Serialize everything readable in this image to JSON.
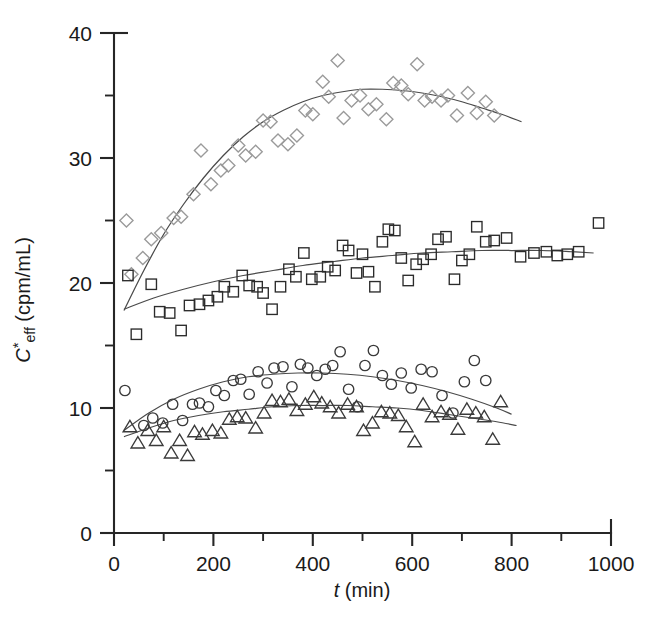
{
  "figure": {
    "background": "#ffffff",
    "width": 650,
    "height": 629
  },
  "axes": {
    "x_title_italic": "t",
    "x_title_units": " (min)",
    "y_title_italic": "C",
    "y_title_star": "*",
    "y_title_sub": "eff",
    "y_title_units": " (cpm/mL)",
    "x_ticks": [
      "0",
      "200",
      "400",
      "600",
      "800",
      "1000"
    ],
    "y_ticks": [
      "0",
      "10",
      "20",
      "30",
      "40"
    ],
    "x_minor_count": 5,
    "y_minor_count": 4,
    "axis_color": "#262626"
  },
  "chart_data": {
    "type": "scatter",
    "title": "",
    "xlabel": "t (min)",
    "ylabel": "C*eff (cpm/mL)",
    "xlim": [
      0,
      1000
    ],
    "ylim": [
      0,
      40
    ],
    "xticks": [
      0,
      200,
      400,
      600,
      800,
      1000
    ],
    "yticks": [
      0,
      10,
      20,
      30,
      40
    ],
    "xminor_step": 100,
    "yminor_step": 5,
    "grid": false,
    "legend": "none",
    "marker_style": "open",
    "series": [
      {
        "name": "diamond",
        "marker": "diamond",
        "color": "#9a9a9a",
        "points": [
          [
            25,
            25.0
          ],
          [
            35,
            20.7
          ],
          [
            58,
            22.0
          ],
          [
            75,
            23.5
          ],
          [
            95,
            24.0
          ],
          [
            120,
            25.2
          ],
          [
            135,
            25.3
          ],
          [
            160,
            27.1
          ],
          [
            175,
            30.6
          ],
          [
            195,
            27.9
          ],
          [
            215,
            29.0
          ],
          [
            230,
            29.4
          ],
          [
            250,
            31.0
          ],
          [
            265,
            30.2
          ],
          [
            285,
            30.5
          ],
          [
            300,
            33.0
          ],
          [
            315,
            32.9
          ],
          [
            330,
            31.4
          ],
          [
            350,
            31.1
          ],
          [
            368,
            31.8
          ],
          [
            385,
            33.8
          ],
          [
            400,
            33.5
          ],
          [
            420,
            36.1
          ],
          [
            432,
            34.9
          ],
          [
            450,
            37.8
          ],
          [
            462,
            33.2
          ],
          [
            478,
            34.6
          ],
          [
            495,
            35.0
          ],
          [
            512,
            33.9
          ],
          [
            528,
            34.3
          ],
          [
            548,
            33.1
          ],
          [
            562,
            36.0
          ],
          [
            578,
            35.8
          ],
          [
            592,
            35.1
          ],
          [
            610,
            37.5
          ],
          [
            625,
            34.6
          ],
          [
            640,
            34.9
          ],
          [
            658,
            34.6
          ],
          [
            672,
            35.0
          ],
          [
            690,
            33.4
          ],
          [
            712,
            35.2
          ],
          [
            730,
            33.6
          ],
          [
            748,
            34.5
          ],
          [
            765,
            33.4
          ]
        ],
        "fit_points": [
          [
            20,
            17.8
          ],
          [
            60,
            21.0
          ],
          [
            100,
            23.9
          ],
          [
            140,
            26.3
          ],
          [
            180,
            28.4
          ],
          [
            220,
            30.2
          ],
          [
            260,
            31.7
          ],
          [
            300,
            32.9
          ],
          [
            340,
            33.8
          ],
          [
            380,
            34.5
          ],
          [
            420,
            35.0
          ],
          [
            460,
            35.3
          ],
          [
            500,
            35.5
          ],
          [
            540,
            35.5
          ],
          [
            580,
            35.4
          ],
          [
            620,
            35.2
          ],
          [
            660,
            34.9
          ],
          [
            700,
            34.5
          ],
          [
            740,
            34.0
          ],
          [
            780,
            33.5
          ],
          [
            820,
            32.9
          ]
        ]
      },
      {
        "name": "square",
        "marker": "square",
        "color": "#2b2b2b",
        "points": [
          [
            28,
            20.6
          ],
          [
            45,
            15.9
          ],
          [
            75,
            19.9
          ],
          [
            92,
            17.7
          ],
          [
            112,
            17.6
          ],
          [
            135,
            16.2
          ],
          [
            152,
            18.2
          ],
          [
            172,
            18.3
          ],
          [
            190,
            18.6
          ],
          [
            208,
            18.9
          ],
          [
            222,
            19.7
          ],
          [
            240,
            19.3
          ],
          [
            258,
            20.6
          ],
          [
            272,
            19.8
          ],
          [
            288,
            19.7
          ],
          [
            300,
            19.2
          ],
          [
            318,
            17.9
          ],
          [
            335,
            19.7
          ],
          [
            352,
            21.1
          ],
          [
            366,
            20.5
          ],
          [
            382,
            22.4
          ],
          [
            398,
            20.3
          ],
          [
            415,
            20.5
          ],
          [
            430,
            21.3
          ],
          [
            445,
            21.0
          ],
          [
            460,
            23.0
          ],
          [
            472,
            22.6
          ],
          [
            488,
            20.8
          ],
          [
            500,
            22.3
          ],
          [
            512,
            20.9
          ],
          [
            525,
            19.7
          ],
          [
            540,
            23.3
          ],
          [
            552,
            24.3
          ],
          [
            565,
            24.2
          ],
          [
            578,
            22.0
          ],
          [
            592,
            20.2
          ],
          [
            608,
            21.5
          ],
          [
            622,
            21.9
          ],
          [
            638,
            22.3
          ],
          [
            652,
            23.5
          ],
          [
            668,
            23.7
          ],
          [
            685,
            20.3
          ],
          [
            700,
            21.8
          ],
          [
            715,
            22.3
          ],
          [
            730,
            24.5
          ],
          [
            748,
            23.3
          ],
          [
            765,
            23.4
          ],
          [
            790,
            23.6
          ],
          [
            818,
            22.1
          ],
          [
            845,
            22.4
          ],
          [
            870,
            22.5
          ],
          [
            892,
            22.2
          ],
          [
            912,
            22.3
          ],
          [
            935,
            22.5
          ],
          [
            975,
            24.8
          ]
        ],
        "fit_points": [
          [
            20,
            17.9
          ],
          [
            80,
            18.8
          ],
          [
            140,
            19.5
          ],
          [
            200,
            20.1
          ],
          [
            260,
            20.6
          ],
          [
            320,
            21.0
          ],
          [
            380,
            21.4
          ],
          [
            440,
            21.7
          ],
          [
            500,
            22.0
          ],
          [
            560,
            22.2
          ],
          [
            620,
            22.4
          ],
          [
            680,
            22.5
          ],
          [
            740,
            22.6
          ],
          [
            800,
            22.6
          ],
          [
            860,
            22.6
          ],
          [
            920,
            22.5
          ],
          [
            965,
            22.4
          ]
        ]
      },
      {
        "name": "circle",
        "marker": "circle",
        "color": "#3a3a3a",
        "points": [
          [
            22,
            11.4
          ],
          [
            60,
            8.6
          ],
          [
            78,
            9.2
          ],
          [
            98,
            8.8
          ],
          [
            118,
            10.3
          ],
          [
            138,
            9.0
          ],
          [
            158,
            10.3
          ],
          [
            172,
            10.4
          ],
          [
            190,
            10.1
          ],
          [
            205,
            11.4
          ],
          [
            222,
            11.0
          ],
          [
            240,
            12.2
          ],
          [
            255,
            12.3
          ],
          [
            272,
            11.1
          ],
          [
            290,
            12.9
          ],
          [
            308,
            12.0
          ],
          [
            322,
            13.2
          ],
          [
            340,
            13.3
          ],
          [
            358,
            11.7
          ],
          [
            375,
            13.5
          ],
          [
            390,
            13.2
          ],
          [
            408,
            12.6
          ],
          [
            425,
            13.1
          ],
          [
            440,
            13.4
          ],
          [
            455,
            14.5
          ],
          [
            472,
            11.5
          ],
          [
            490,
            10.1
          ],
          [
            505,
            13.4
          ],
          [
            522,
            14.6
          ],
          [
            540,
            12.6
          ],
          [
            558,
            11.9
          ],
          [
            578,
            12.8
          ],
          [
            598,
            11.6
          ],
          [
            618,
            13.1
          ],
          [
            640,
            12.9
          ],
          [
            660,
            11.0
          ],
          [
            682,
            9.6
          ],
          [
            705,
            12.1
          ],
          [
            725,
            13.8
          ],
          [
            748,
            12.2
          ]
        ],
        "fit_points": [
          [
            20,
            8.2
          ],
          [
            70,
            9.6
          ],
          [
            120,
            10.7
          ],
          [
            170,
            11.5
          ],
          [
            220,
            12.1
          ],
          [
            270,
            12.5
          ],
          [
            320,
            12.7
          ],
          [
            370,
            12.8
          ],
          [
            420,
            12.8
          ],
          [
            470,
            12.7
          ],
          [
            520,
            12.5
          ],
          [
            570,
            12.2
          ],
          [
            620,
            11.8
          ],
          [
            670,
            11.3
          ],
          [
            720,
            10.7
          ],
          [
            770,
            10.0
          ],
          [
            800,
            9.5
          ]
        ]
      },
      {
        "name": "triangle",
        "marker": "triangle",
        "color": "#3a3a3a",
        "points": [
          [
            32,
            8.5
          ],
          [
            48,
            7.2
          ],
          [
            68,
            8.2
          ],
          [
            85,
            7.4
          ],
          [
            100,
            8.5
          ],
          [
            115,
            6.4
          ],
          [
            132,
            7.4
          ],
          [
            148,
            6.2
          ],
          [
            162,
            8.1
          ],
          [
            178,
            7.9
          ],
          [
            198,
            8.2
          ],
          [
            215,
            8.0
          ],
          [
            232,
            9.1
          ],
          [
            248,
            9.3
          ],
          [
            265,
            9.2
          ],
          [
            285,
            8.4
          ],
          [
            302,
            9.6
          ],
          [
            318,
            10.6
          ],
          [
            335,
            10.5
          ],
          [
            352,
            10.7
          ],
          [
            368,
            9.8
          ],
          [
            385,
            10.3
          ],
          [
            402,
            10.9
          ],
          [
            418,
            10.4
          ],
          [
            435,
            10.1
          ],
          [
            452,
            9.6
          ],
          [
            470,
            10.3
          ],
          [
            488,
            10.1
          ],
          [
            502,
            8.2
          ],
          [
            520,
            8.8
          ],
          [
            538,
            9.7
          ],
          [
            555,
            9.6
          ],
          [
            572,
            9.4
          ],
          [
            588,
            8.5
          ],
          [
            605,
            7.3
          ],
          [
            622,
            10.3
          ],
          [
            640,
            9.3
          ],
          [
            658,
            9.7
          ],
          [
            675,
            9.5
          ],
          [
            692,
            8.3
          ],
          [
            710,
            9.9
          ],
          [
            728,
            9.6
          ],
          [
            745,
            9.3
          ],
          [
            762,
            7.5
          ],
          [
            778,
            10.5
          ]
        ],
        "fit_points": [
          [
            20,
            7.7
          ],
          [
            70,
            8.4
          ],
          [
            120,
            9.0
          ],
          [
            170,
            9.4
          ],
          [
            220,
            9.7
          ],
          [
            270,
            9.9
          ],
          [
            320,
            10.1
          ],
          [
            370,
            10.2
          ],
          [
            420,
            10.2
          ],
          [
            470,
            10.2
          ],
          [
            520,
            10.1
          ],
          [
            570,
            10.0
          ],
          [
            620,
            9.8
          ],
          [
            670,
            9.5
          ],
          [
            720,
            9.2
          ],
          [
            770,
            8.9
          ],
          [
            810,
            8.6
          ]
        ]
      }
    ]
  }
}
